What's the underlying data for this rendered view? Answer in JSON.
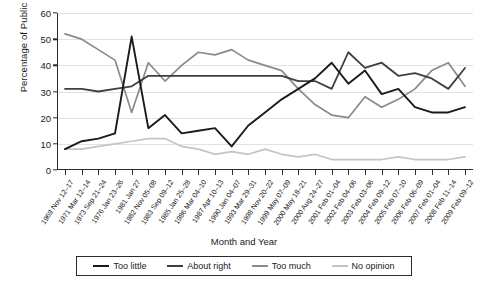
{
  "chart_data": {
    "type": "line",
    "title": "",
    "xlabel": "Month and Year",
    "ylabel": "Percentage of Public",
    "ylim": [
      0,
      60
    ],
    "yticks": [
      0,
      10,
      20,
      30,
      40,
      50,
      60
    ],
    "grid": true,
    "legend_position": "bottom",
    "categories": [
      "1969 Nov 12–17",
      "1971 Mar 12–14",
      "1973 Sep 21–24",
      "1976 Jan 23–26",
      "1981 Jan 27",
      "1982 Nov 05–08",
      "1983 Sep 09–12",
      "1985 Jan 25–28",
      "1986 Mar 04–10",
      "1987 Apr 10–13",
      "1990 Jan 04–07",
      "1993 Mar 29–31",
      "1998 Nov 20–22",
      "1999 May 07–09",
      "2000 May 18–21",
      "2000 Aug 24–27",
      "2001 Feb 01–04",
      "2002 Feb 04–06",
      "2003 Feb 03–06",
      "2004 Feb 09–12",
      "2005 Feb 07–10",
      "2006 Feb 06–09",
      "2007 Feb 01–04",
      "2008 Feb 11–14",
      "2009 Feb 09–12"
    ],
    "series": [
      {
        "name": "Too little",
        "color": "#1a1a1a",
        "values": [
          8,
          11,
          12,
          14,
          51,
          16,
          21,
          14,
          15,
          16,
          9,
          17,
          22,
          27,
          31,
          35,
          41,
          33,
          38,
          29,
          31,
          24,
          22,
          22,
          24
        ]
      },
      {
        "name": "About right",
        "color": "#3f3f3f",
        "values": [
          31,
          31,
          30,
          31,
          32,
          36,
          36,
          36,
          36,
          36,
          36,
          36,
          36,
          36,
          34,
          34,
          31,
          45,
          39,
          41,
          36,
          37,
          35,
          31,
          39
        ]
      },
      {
        "name": "Too much",
        "color": "#8a8a8a",
        "values": [
          52,
          50,
          46,
          42,
          22,
          41,
          34,
          40,
          45,
          44,
          46,
          42,
          40,
          38,
          31,
          25,
          21,
          20,
          28,
          24,
          27,
          31,
          38,
          41,
          32
        ]
      },
      {
        "name": "No opinion",
        "color": "#c4c4c4",
        "values": [
          8,
          8,
          9,
          10,
          11,
          12,
          12,
          9,
          8,
          6,
          7,
          6,
          8,
          6,
          5,
          6,
          4,
          4,
          4,
          4,
          5,
          4,
          4,
          4,
          5
        ]
      }
    ]
  },
  "legend": {
    "items": [
      {
        "label": "Too little",
        "color": "#1a1a1a"
      },
      {
        "label": "About right",
        "color": "#3f3f3f"
      },
      {
        "label": "Too much",
        "color": "#8a8a8a"
      },
      {
        "label": "No opinion",
        "color": "#c4c4c4"
      }
    ]
  },
  "axes": {
    "y_title": "Percentage of Public",
    "x_title": "Month and Year"
  }
}
